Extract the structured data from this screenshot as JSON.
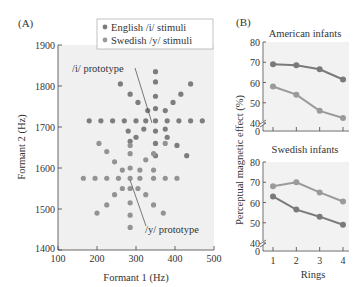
{
  "chart_data": [
    {
      "panel": "(A)",
      "type": "scatter",
      "title": "",
      "xlabel": "Formant 1 (Hz)",
      "ylabel": "Formant 2 (Hz)",
      "xlim": [
        100,
        500
      ],
      "ylim": [
        1400,
        1900
      ],
      "xticks": [
        "100",
        "200",
        "300",
        "400",
        "500"
      ],
      "yticks": [
        "1400",
        "1500",
        "1600",
        "1700",
        "1800",
        "1900"
      ],
      "legend": [
        "English /i/ stimuli",
        "Swedish /y/ stimuli"
      ],
      "legend_position": "top-right",
      "annotations": [
        "/i/ prototype",
        "/y/ prototype"
      ],
      "grid": false,
      "series": [
        {
          "name": "English /i/ stimuli",
          "color": "#8a8a8a",
          "prototype": [
            350,
            1715
          ],
          "points": [
            [
              350,
              1835
            ],
            [
              350,
              1810
            ],
            [
              350,
              1775
            ],
            [
              350,
              1745
            ],
            [
              350,
              1715
            ],
            [
              350,
              1690
            ],
            [
              350,
              1660
            ],
            [
              350,
              1630
            ],
            [
              260,
              1805
            ],
            [
              285,
              1780
            ],
            [
              305,
              1760
            ],
            [
              330,
              1740
            ],
            [
              375,
              1740
            ],
            [
              395,
              1760
            ],
            [
              415,
              1780
            ],
            [
              440,
              1805
            ],
            [
              180,
              1715
            ],
            [
              210,
              1715
            ],
            [
              240,
              1715
            ],
            [
              270,
              1715
            ],
            [
              300,
              1715
            ],
            [
              325,
              1715
            ],
            [
              380,
              1715
            ],
            [
              410,
              1715
            ],
            [
              440,
              1715
            ],
            [
              470,
              1715
            ],
            [
              280,
              1690
            ],
            [
              320,
              1695
            ],
            [
              375,
              1695
            ],
            [
              380,
              1675
            ],
            [
              300,
              1675
            ],
            [
              285,
              1665
            ],
            [
              405,
              1655
            ],
            [
              430,
              1630
            ]
          ]
        },
        {
          "name": "Swedish /y/ stimuli",
          "color": "#8a8a8a",
          "prototype": [
            285,
            1575
          ],
          "points": [
            [
              285,
              1655
            ],
            [
              285,
              1635
            ],
            [
              285,
              1600
            ],
            [
              285,
              1575
            ],
            [
              285,
              1550
            ],
            [
              285,
              1515
            ],
            [
              285,
              1485
            ],
            [
              285,
              1455
            ],
            [
              205,
              1660
            ],
            [
              225,
              1640
            ],
            [
              245,
              1615
            ],
            [
              265,
              1595
            ],
            [
              310,
              1595
            ],
            [
              325,
              1620
            ],
            [
              345,
              1635
            ],
            [
              375,
              1660
            ],
            [
              165,
              1575
            ],
            [
              195,
              1575
            ],
            [
              225,
              1575
            ],
            [
              255,
              1575
            ],
            [
              310,
              1575
            ],
            [
              345,
              1575
            ],
            [
              375,
              1575
            ],
            [
              405,
              1575
            ],
            [
              265,
              1550
            ],
            [
              305,
              1550
            ],
            [
              245,
              1535
            ],
            [
              325,
              1535
            ],
            [
              225,
              1510
            ],
            [
              345,
              1510
            ],
            [
              200,
              1490
            ],
            [
              370,
              1490
            ],
            [
              345,
              1595
            ]
          ]
        }
      ]
    },
    {
      "panel": "(B)",
      "type": "line",
      "title": "American infants",
      "xlabel": "",
      "ylabel": "Perceptual magnetic effect (%)",
      "categories": [
        1,
        2,
        3,
        4
      ],
      "ylim": [
        0,
        80
      ],
      "yticks": [
        "0",
        "40",
        "50",
        "60",
        "70",
        "80"
      ],
      "axis_break": true,
      "series": [
        {
          "name": "English /i/ stimuli",
          "color": "#7a7a7a",
          "values": [
            69,
            68.5,
            66.5,
            61.5
          ]
        },
        {
          "name": "Swedish /y/ stimuli",
          "color": "#9a9a9a",
          "values": [
            58,
            54,
            46,
            42.5
          ]
        }
      ]
    },
    {
      "panel": "(B)",
      "type": "line",
      "title": "Swedish infants",
      "xlabel": "Rings",
      "ylabel": "Perceptual magnetic effect (%)",
      "categories": [
        1,
        2,
        3,
        4
      ],
      "ylim": [
        0,
        80
      ],
      "yticks": [
        "0",
        "40",
        "50",
        "60",
        "70",
        "80"
      ],
      "xticks": [
        "1",
        "2",
        "3",
        "4"
      ],
      "axis_break": true,
      "series": [
        {
          "name": "English /i/ stimuli",
          "color": "#7a7a7a",
          "values": [
            63,
            56.5,
            53,
            49
          ]
        },
        {
          "name": "Swedish /y/ stimuli",
          "color": "#9a9a9a",
          "values": [
            68,
            70,
            65,
            60.5
          ]
        }
      ]
    }
  ],
  "labels": {
    "panelA": "(A)",
    "panelB": "(B)",
    "legend_english": "English /i/ stimuli",
    "legend_swedish": "Swedish /y/ stimuli",
    "i_proto": "/i/ prototype",
    "y_proto": "/y/ prototype",
    "a_xlabel": "Formant 1 (Hz)",
    "a_ylabel": "Formant 2 (Hz)",
    "b_ylabel": "Perceptual magnetic effect (%)",
    "b_xlabel": "Rings",
    "american_title": "American infants",
    "swedish_title": "Swedish infants"
  }
}
